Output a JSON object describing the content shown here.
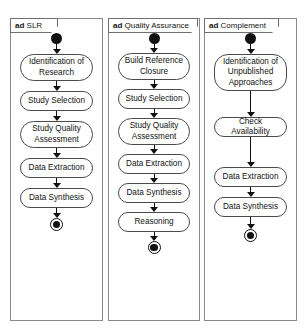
{
  "diagram": {
    "kind": "uml-activity-diagram",
    "background_color": "#ffffff",
    "border_color": "#8a8a8a",
    "node_fill": "#ffffff",
    "node_border_color": "#4a4a4a",
    "ink_color": "#111111",
    "keyword": "ad",
    "panels": [
      {
        "id": "slr",
        "keyword": "ad",
        "name": "SLR",
        "start_label": "initial-node",
        "end_label": "final-node",
        "actions": [
          {
            "label": "Identification of Research"
          },
          {
            "label": "Study Selection"
          },
          {
            "label": "Study Quality Assessment"
          },
          {
            "label": "Data Extraction"
          },
          {
            "label": "Data Synthesis"
          }
        ]
      },
      {
        "id": "quality-assurance",
        "keyword": "ad",
        "name": "Quality Assurance",
        "start_label": "initial-node",
        "end_label": "final-node",
        "actions": [
          {
            "label": "Build Reference Closure"
          },
          {
            "label": "Study Selection"
          },
          {
            "label": "Study Quality Assessment"
          },
          {
            "label": "Data Extraction"
          },
          {
            "label": "Data Synthesis"
          },
          {
            "label": "Reasoning"
          }
        ]
      },
      {
        "id": "complement",
        "keyword": "ad",
        "name": "Complement",
        "start_label": "initial-node",
        "end_label": "final-node",
        "actions": [
          {
            "label": "Identification of Unpublished Approaches"
          },
          {
            "label": "Check Availability"
          },
          {
            "label": "Data Extraction"
          },
          {
            "label": "Data Synthesis"
          }
        ]
      }
    ]
  }
}
